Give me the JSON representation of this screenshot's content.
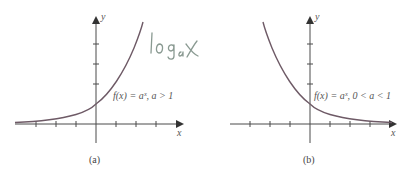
{
  "figure": {
    "panels": [
      {
        "id": "a",
        "caption": "(a)",
        "x_label": "x",
        "y_label": "y",
        "function_label": "f(x) = aˣ, a > 1",
        "annotation": "logₐx"
      },
      {
        "id": "b",
        "caption": "(b)",
        "x_label": "x",
        "y_label": "y",
        "function_label": "f(x) = aˣ, 0 < a < 1"
      }
    ],
    "colors": {
      "axis": "#4a4a4a",
      "curve": "#6e5a66",
      "handwriting": "#8a9a92"
    }
  }
}
